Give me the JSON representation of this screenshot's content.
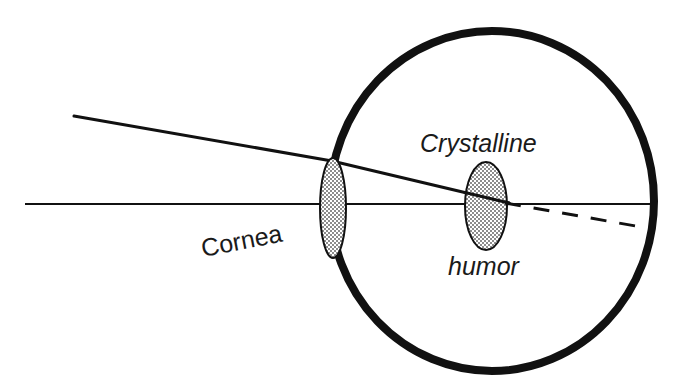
{
  "diagram": {
    "background_color": "#ffffff",
    "ink_color": "#111111",
    "stipple_color": "#8c8c8c",
    "labels": {
      "cornea": "Cornea",
      "crystalline": "Crystalline",
      "humor": "humor"
    },
    "label_geometry": {
      "cornea": {
        "x": 203,
        "y": 257,
        "font_size": 25,
        "rotation": -11,
        "style": "upright"
      },
      "crystalline": {
        "x": 420,
        "y": 152,
        "font_size": 25,
        "rotation": 0,
        "style": "italic"
      },
      "humor": {
        "x": 448,
        "y": 275,
        "font_size": 25,
        "rotation": 0,
        "style": "italic"
      }
    },
    "parts": {
      "eyeball": {
        "name": "eyeball-outline",
        "shape": "ellipse",
        "cx": 492,
        "cy": 201,
        "rx": 162,
        "ry": 170,
        "stroke_width": 8,
        "fill": "none"
      },
      "cornea_lens": {
        "name": "cornea-lens",
        "shape": "ellipse",
        "cx": 333,
        "cy": 208,
        "rx": 13,
        "ry": 50,
        "stroke_width": 2,
        "fill": "stipple"
      },
      "crystalline_lens": {
        "name": "crystalline-lens",
        "shape": "ellipse",
        "cx": 486,
        "cy": 206,
        "rx": 21,
        "ry": 44,
        "stroke_width": 2,
        "fill": "stipple"
      }
    },
    "rays": {
      "optical_axis": {
        "name": "optical-axis",
        "style": "solid",
        "stroke_width": 2,
        "points": [
          [
            25,
            204
          ],
          [
            655,
            204
          ]
        ]
      },
      "incident_ray": {
        "name": "incident-ray",
        "style": "solid",
        "stroke_width": 3,
        "points": [
          [
            74,
            116
          ],
          [
            332,
            161
          ]
        ]
      },
      "refracted_ray_interior": {
        "name": "refracted-ray-interior",
        "style": "solid",
        "stroke_width": 3,
        "points": [
          [
            332,
            161
          ],
          [
            509,
            203
          ]
        ]
      },
      "projected_ray": {
        "name": "projected-ray-dashed",
        "style": "dashed",
        "stroke_width": 3,
        "dash_pattern": "16 13",
        "points": [
          [
            505,
            203
          ],
          [
            647,
            228
          ]
        ]
      }
    }
  }
}
